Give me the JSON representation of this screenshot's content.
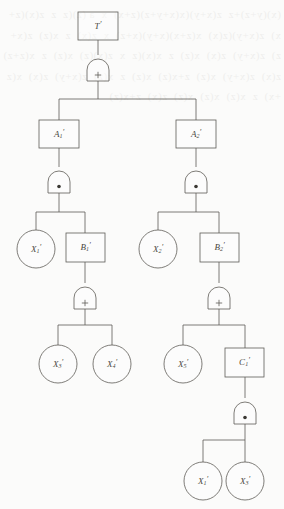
{
  "diagram": {
    "type": "fault-tree",
    "background_color": "#fbfbfa",
    "line_color": "#5e5c57",
    "gate_symbols": {
      "or": "+",
      "and": "•"
    },
    "bleed_text": "(x)(y+z)+z  z(x+y)(x(x+y+z)(z+x)  x  a (z)(z  z  z(x)(z+x)  z(x+y)(z(x)  x(z+x)(x+y)(x+z)  x  z(x)  z  x(z)  z(x+z)  z(x+y)  z(x)  x(z)  z  x(x)(z  x  z(x)(z)  x(z)  z  x(z+z)  z(x)  z(x+y)  x(z)  z+x(z)  x(z)  z  x(z)  z(x+y)  z(x)  x(z+x)  z  x(z)  x(z)  x(z)  z(x)  z+x(z)"
  },
  "nodes": {
    "top": {
      "id": "T",
      "label": "T",
      "prime": "′",
      "sub": "",
      "shape": "rect",
      "kind": "top-event"
    },
    "g1": {
      "id": "g1",
      "symbol": "+",
      "kind": "or-gate"
    },
    "a1": {
      "id": "A1",
      "label": "A",
      "prime": "′",
      "sub": "1",
      "shape": "rect",
      "kind": "intermediate-event"
    },
    "a2": {
      "id": "A2",
      "label": "A",
      "prime": "′",
      "sub": "2",
      "shape": "rect",
      "kind": "intermediate-event"
    },
    "g2": {
      "id": "g2",
      "symbol": "•",
      "kind": "and-gate"
    },
    "g3": {
      "id": "g3",
      "symbol": "•",
      "kind": "and-gate"
    },
    "x1": {
      "id": "X1",
      "label": "X",
      "prime": "′",
      "sub": "1",
      "shape": "circle",
      "kind": "basic-event"
    },
    "b1": {
      "id": "B1",
      "label": "B",
      "prime": "′",
      "sub": "1",
      "shape": "rect",
      "kind": "intermediate-event"
    },
    "x2": {
      "id": "X2",
      "label": "X",
      "prime": "′",
      "sub": "2",
      "shape": "circle",
      "kind": "basic-event"
    },
    "b2": {
      "id": "B2",
      "label": "B",
      "prime": "′",
      "sub": "2",
      "shape": "rect",
      "kind": "intermediate-event"
    },
    "g4": {
      "id": "g4",
      "symbol": "+",
      "kind": "or-gate"
    },
    "g5": {
      "id": "g5",
      "symbol": "+",
      "kind": "or-gate"
    },
    "x3": {
      "id": "X3",
      "label": "X",
      "prime": "′",
      "sub": "3",
      "shape": "circle",
      "kind": "basic-event"
    },
    "x4": {
      "id": "X4",
      "label": "X",
      "prime": "′",
      "sub": "4",
      "shape": "circle",
      "kind": "basic-event"
    },
    "x5": {
      "id": "X5",
      "label": "X",
      "prime": "′",
      "sub": "5",
      "shape": "circle",
      "kind": "basic-event"
    },
    "c1": {
      "id": "C1",
      "label": "C",
      "prime": "′",
      "sub": "1",
      "shape": "rect",
      "kind": "intermediate-event"
    },
    "g6": {
      "id": "g6",
      "symbol": "•",
      "kind": "and-gate"
    },
    "x1b": {
      "id": "X1b",
      "label": "X",
      "prime": "′",
      "sub": "1",
      "shape": "circle",
      "kind": "basic-event"
    },
    "x3b": {
      "id": "X3b",
      "label": "X",
      "prime": "′",
      "sub": "3",
      "shape": "circle",
      "kind": "basic-event"
    }
  },
  "edges": [
    {
      "from": "top",
      "to": "g1"
    },
    {
      "from": "g1",
      "to": "a1"
    },
    {
      "from": "g1",
      "to": "a2"
    },
    {
      "from": "a1",
      "to": "g2"
    },
    {
      "from": "a2",
      "to": "g3"
    },
    {
      "from": "g2",
      "to": "x1"
    },
    {
      "from": "g2",
      "to": "b1"
    },
    {
      "from": "g3",
      "to": "x2"
    },
    {
      "from": "g3",
      "to": "b2"
    },
    {
      "from": "b1",
      "to": "g4"
    },
    {
      "from": "b2",
      "to": "g5"
    },
    {
      "from": "g4",
      "to": "x3"
    },
    {
      "from": "g4",
      "to": "x4"
    },
    {
      "from": "g5",
      "to": "x5"
    },
    {
      "from": "g5",
      "to": "c1"
    },
    {
      "from": "c1",
      "to": "g6"
    },
    {
      "from": "g6",
      "to": "x1b"
    },
    {
      "from": "g6",
      "to": "x3b"
    }
  ]
}
